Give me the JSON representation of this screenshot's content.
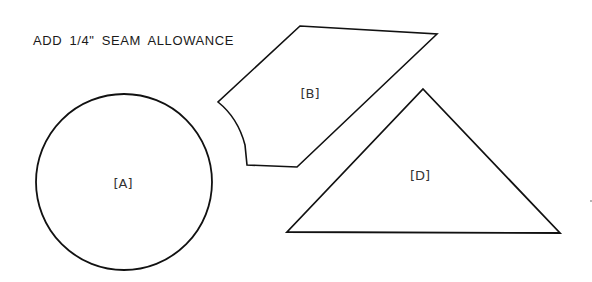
{
  "title": "ADD 1/4\" SEAM ALLOWANCE",
  "pieces": [
    {
      "id": "A",
      "label": "[A]",
      "shape": "circle"
    },
    {
      "id": "B",
      "label": "[B]",
      "shape": "polygon"
    },
    {
      "id": "D",
      "label": "[D]",
      "shape": "triangle"
    }
  ],
  "colors": {
    "stroke": "#111111",
    "background": "#ffffff"
  }
}
